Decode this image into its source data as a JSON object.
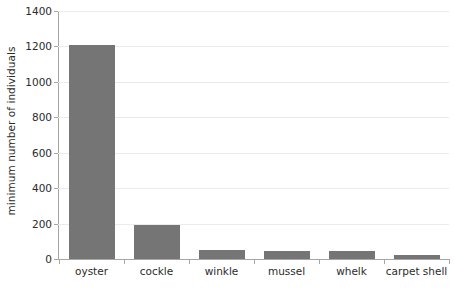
{
  "chart_data": {
    "type": "bar",
    "title": "",
    "xlabel": "",
    "ylabel": "minimum number of individuals",
    "categories": [
      "oyster",
      "cockle",
      "winkle",
      "mussel",
      "whelk",
      "carpet shell"
    ],
    "values": [
      1210,
      190,
      53,
      43,
      43,
      25
    ],
    "ylim": [
      0,
      1400
    ],
    "yticks": [
      0,
      200,
      400,
      600,
      800,
      1000,
      1200,
      1400
    ],
    "ytick_labels": [
      "0",
      "200",
      "400",
      "600",
      "800",
      "1000",
      "1200",
      "1400"
    ],
    "grid": true,
    "legend": "none",
    "series": [
      {
        "name": "minimum number of individuals",
        "values": [
          1210,
          190,
          53,
          43,
          43,
          25
        ],
        "color": "#757575"
      }
    ],
    "colors": {
      "bar": "#757575",
      "gridline": "#ebebeb",
      "axis": "#a6a6a6",
      "text": "#2b2b2b",
      "background": "#ffffff"
    }
  }
}
